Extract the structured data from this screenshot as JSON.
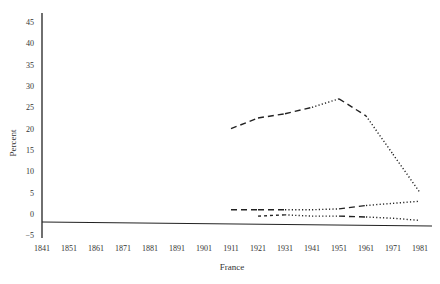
{
  "chart_data": {
    "type": "line",
    "title": "",
    "xlabel": "France",
    "ylabel": "Percent",
    "x": [
      1841,
      1851,
      1861,
      1871,
      1881,
      1891,
      1901,
      1911,
      1921,
      1931,
      1941,
      1951,
      1961,
      1971,
      1981
    ],
    "xticks": [
      "1841",
      "1851",
      "1861",
      "1871",
      "1881",
      "1891",
      "1901",
      "1911",
      "1921",
      "1931",
      "1941",
      "1951",
      "1961",
      "1971",
      "1981"
    ],
    "yticks": [
      "45",
      "40",
      "35",
      "30",
      "25",
      "20",
      "15",
      "10",
      "5",
      "0",
      "−5"
    ],
    "ylim": [
      -5,
      45
    ],
    "grid": false,
    "legend": null,
    "series": [
      {
        "name": "upper series",
        "style": "dash-dot mix",
        "x": [
          1911,
          1921,
          1931,
          1941,
          1951,
          1961,
          1971,
          1981
        ],
        "values": [
          20,
          22.5,
          23.5,
          25,
          27,
          23,
          14,
          5
        ]
      },
      {
        "name": "middle series",
        "style": "dash-dot mix",
        "x": [
          1911,
          1921,
          1931,
          1941,
          1951,
          1961,
          1971,
          1981
        ],
        "values": [
          1,
          1,
          1,
          1,
          1.2,
          2,
          2.5,
          3
        ]
      },
      {
        "name": "lower series",
        "style": "dash-dot mix",
        "x": [
          1921,
          1931,
          1941,
          1951,
          1961,
          1971,
          1981
        ],
        "values": [
          -0.5,
          -0.2,
          -0.5,
          -0.5,
          -0.7,
          -1,
          -1.5
        ]
      }
    ]
  }
}
